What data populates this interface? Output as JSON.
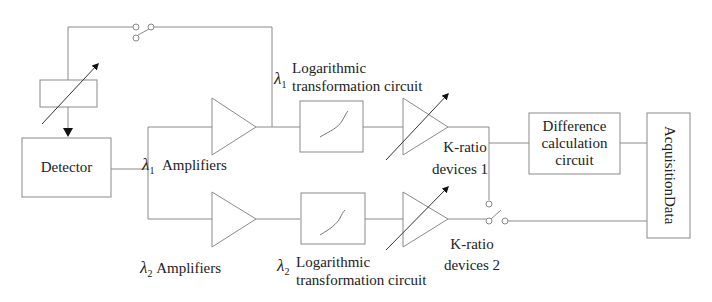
{
  "diagram": {
    "type": "signal-processing block diagram",
    "colors": {
      "line": "#8a8a8a",
      "text": "#222222",
      "background": "#ffffff"
    },
    "blocks": {
      "attenuator": {
        "label": "",
        "icon": "variable-adjust-arrow"
      },
      "detector": {
        "label": "Detector"
      },
      "amplifier_1": {
        "symbol": "λ",
        "subscript": "1",
        "label": "Amplifiers"
      },
      "amplifier_2": {
        "symbol": "λ",
        "subscript": "2",
        "label": "Amplifiers"
      },
      "log_circuit_1": {
        "symbol": "λ",
        "subscript": "1",
        "line1": "Logarithmic",
        "line2": "transformation circuit"
      },
      "log_circuit_2": {
        "symbol": "λ",
        "subscript": "2",
        "line1": "Logarithmic",
        "line2": "transformation circuit"
      },
      "k_ratio_1": {
        "line1": "K-ratio",
        "line2": "devices 1"
      },
      "k_ratio_2": {
        "line1": "K-ratio",
        "line2": "devices 2"
      },
      "difference": {
        "line1": "Difference",
        "line2": "calculation",
        "line3": "circuit"
      },
      "data_acquisition": {
        "line1": "Data",
        "line2": "Acquisition"
      }
    },
    "switches": [
      {
        "name": "feedback-switch",
        "location": "top wire"
      },
      {
        "name": "output-selector-switch",
        "location": "k-ratio outputs to data acquisition"
      }
    ]
  }
}
